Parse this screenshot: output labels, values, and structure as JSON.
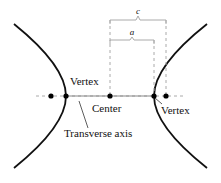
{
  "diagram": {
    "labels": {
      "vertex_left": "Vertex",
      "vertex_right": "Vertex",
      "center": "Center",
      "transverse_axis": "Transverse axis",
      "c": "c",
      "a": "a"
    },
    "colors": {
      "curve": "#111111",
      "axis": "#999999",
      "dashed": "#aaaaaa",
      "point": "#000000"
    }
  }
}
